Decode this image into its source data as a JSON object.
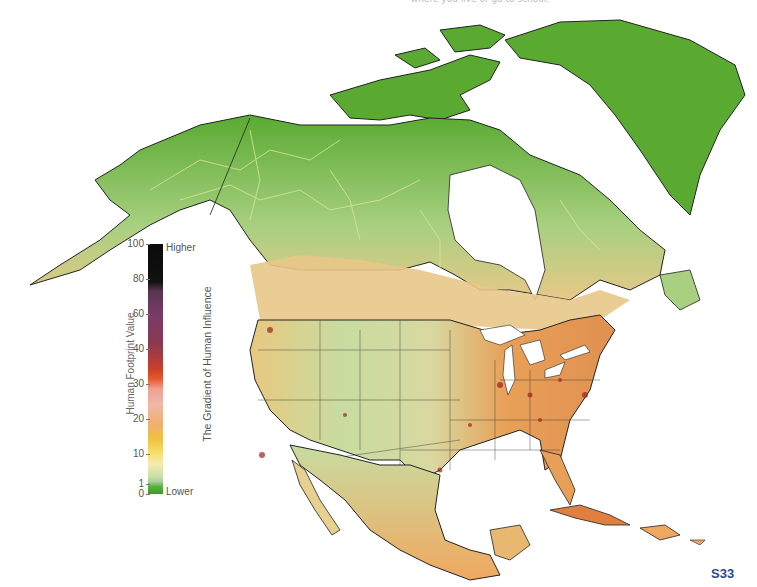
{
  "page": {
    "top_caption": "where you live or go to school.",
    "page_number": "S33"
  },
  "legend": {
    "axis_title": "Human Footprint Value",
    "gradient_title": "The Gradient of Human Influence",
    "high_label": "Higher",
    "low_label": "Lower",
    "ticks": [
      "100",
      "80",
      "60",
      "40",
      "30",
      "20",
      "10",
      "1",
      "0"
    ],
    "gradient_colors": [
      "#0a0a0a",
      "#7a3a6a",
      "#c8402a",
      "#e65a30",
      "#f0b8a8",
      "#f0c040",
      "#f5ecb0",
      "#a8d0a0",
      "#3a9a2a"
    ]
  },
  "map": {
    "region": "North America",
    "colors": {
      "wilderness": "#5aaa32",
      "low": "#b8d898",
      "moderate": "#f0c878",
      "high": "#e08040",
      "urban": "#a02020",
      "water": "#ffffff",
      "border": "#333333"
    }
  }
}
